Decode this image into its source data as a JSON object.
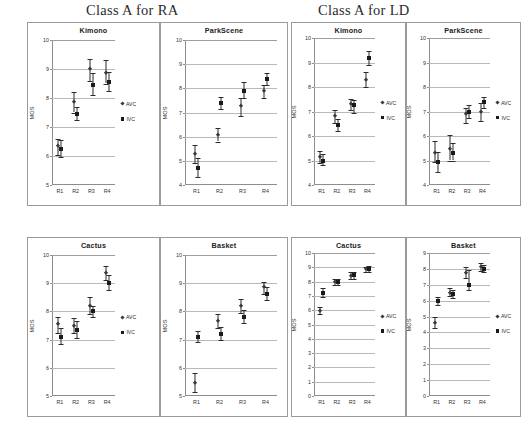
{
  "figure": {
    "groups": [
      {
        "id": "ra",
        "title": "Class A for RA"
      },
      {
        "id": "ld",
        "title": "Class A for LD"
      }
    ],
    "series_legend": [
      {
        "name": "AVC",
        "marker": "diamond-marker"
      },
      {
        "name": "IVC",
        "marker": "square-marker"
      }
    ],
    "axis": {
      "ylabel": "MOS",
      "xcategories": [
        "R1",
        "R2",
        "R3",
        "R4"
      ]
    }
  },
  "chart_data": [
    {
      "id": "ra-kimono",
      "type": "scatter",
      "group": "Class A for RA",
      "title": "Kimono",
      "xlabel": "",
      "ylabel": "MOS",
      "ylim": [
        5,
        10
      ],
      "yticks": [
        5,
        6,
        7,
        8,
        9,
        10
      ],
      "grid": true,
      "legend_position": "right",
      "categories": [
        "R1",
        "R2",
        "R3",
        "R4"
      ],
      "series": [
        {
          "name": "AVC",
          "marker": "diamond",
          "values": [
            6.35,
            7.85,
            9.0,
            8.85
          ],
          "err_low": [
            6.05,
            7.5,
            8.6,
            8.5
          ],
          "err_high": [
            6.6,
            8.2,
            9.35,
            9.3
          ]
        },
        {
          "name": "IVC",
          "marker": "square",
          "values": [
            6.25,
            7.45,
            8.45,
            8.55
          ],
          "err_low": [
            5.95,
            7.25,
            8.1,
            8.25
          ],
          "err_high": [
            6.55,
            7.7,
            8.85,
            8.9
          ]
        }
      ]
    },
    {
      "id": "ra-parkscene",
      "type": "scatter",
      "group": "Class A for RA",
      "title": "ParkScene",
      "xlabel": "",
      "ylabel": "MOS",
      "ylim": [
        4,
        10
      ],
      "yticks": [
        4,
        5,
        6,
        7,
        8,
        9,
        10
      ],
      "grid": true,
      "legend_position": "none",
      "categories": [
        "R1",
        "R2",
        "R3",
        "R4"
      ],
      "series": [
        {
          "name": "AVC",
          "marker": "diamond",
          "values": [
            5.3,
            6.05,
            7.25,
            7.9
          ],
          "err_low": [
            4.9,
            5.8,
            6.85,
            7.6
          ],
          "err_high": [
            5.65,
            6.35,
            7.6,
            8.15
          ]
        },
        {
          "name": "IVC",
          "marker": "square",
          "values": [
            4.7,
            7.4,
            7.9,
            8.4
          ],
          "err_low": [
            4.35,
            7.15,
            7.6,
            8.15
          ],
          "err_high": [
            5.1,
            7.65,
            8.25,
            8.65
          ]
        }
      ]
    },
    {
      "id": "ra-cactus",
      "type": "scatter",
      "group": "Class A for RA",
      "title": "Cactus",
      "xlabel": "",
      "ylabel": "MOS",
      "ylim": [
        5,
        10
      ],
      "yticks": [
        5,
        6,
        7,
        8,
        9,
        10
      ],
      "grid": true,
      "legend_position": "right",
      "categories": [
        "R1",
        "R2",
        "R3",
        "R4"
      ],
      "series": [
        {
          "name": "AVC",
          "marker": "diamond",
          "values": [
            7.55,
            7.5,
            8.2,
            9.35
          ],
          "err_low": [
            7.25,
            7.25,
            7.9,
            9.1
          ],
          "err_high": [
            7.8,
            7.75,
            8.5,
            9.6
          ]
        },
        {
          "name": "IVC",
          "marker": "square",
          "values": [
            7.1,
            7.35,
            8.0,
            9.0
          ],
          "err_low": [
            6.85,
            7.05,
            7.8,
            8.75
          ],
          "err_high": [
            7.4,
            7.65,
            8.2,
            9.3
          ]
        }
      ]
    },
    {
      "id": "ra-basket",
      "type": "scatter",
      "group": "Class A for RA",
      "title": "Basket",
      "xlabel": "",
      "ylabel": "MOS",
      "ylim": [
        5,
        10
      ],
      "yticks": [
        5,
        6,
        7,
        8,
        9,
        10
      ],
      "grid": true,
      "legend_position": "none",
      "categories": [
        "R1",
        "R2",
        "R3",
        "R4"
      ],
      "series": [
        {
          "name": "AVC",
          "marker": "diamond",
          "values": [
            5.45,
            7.65,
            8.2,
            8.85
          ],
          "err_low": [
            5.15,
            7.4,
            7.95,
            8.6
          ],
          "err_high": [
            5.8,
            7.9,
            8.45,
            9.05
          ]
        },
        {
          "name": "IVC",
          "marker": "square",
          "values": [
            7.1,
            7.2,
            7.8,
            8.6
          ],
          "err_low": [
            6.9,
            7.0,
            7.6,
            8.4
          ],
          "err_high": [
            7.3,
            7.45,
            8.05,
            8.85
          ]
        }
      ]
    },
    {
      "id": "ld-kimono",
      "type": "scatter",
      "group": "Class A for LD",
      "title": "Kimono",
      "xlabel": "",
      "ylabel": "MOS",
      "ylim": [
        4,
        10
      ],
      "yticks": [
        4,
        5,
        6,
        7,
        8,
        9,
        10
      ],
      "grid": true,
      "legend_position": "right",
      "categories": [
        "R1",
        "R2",
        "R3",
        "R4"
      ],
      "series": [
        {
          "name": "AVC",
          "marker": "diamond",
          "values": [
            5.15,
            6.8,
            7.3,
            8.3
          ],
          "err_low": [
            4.9,
            6.55,
            7.05,
            8.0
          ],
          "err_high": [
            5.4,
            7.05,
            7.5,
            8.6
          ]
        },
        {
          "name": "IVC",
          "marker": "square",
          "values": [
            5.0,
            6.45,
            7.25,
            9.2
          ],
          "err_low": [
            4.8,
            6.2,
            6.95,
            8.9
          ],
          "err_high": [
            5.25,
            6.7,
            7.45,
            9.45
          ]
        }
      ]
    },
    {
      "id": "ld-parkscene",
      "type": "scatter",
      "group": "Class A for LD",
      "title": "ParkScene",
      "xlabel": "",
      "ylabel": "MOS",
      "ylim": [
        4,
        10
      ],
      "yticks": [
        4,
        5,
        6,
        7,
        8,
        9,
        10
      ],
      "grid": true,
      "legend_position": "right",
      "categories": [
        "R1",
        "R2",
        "R3",
        "R4"
      ],
      "series": [
        {
          "name": "AVC",
          "marker": "diamond",
          "values": [
            5.3,
            5.45,
            6.9,
            7.0
          ],
          "err_low": [
            4.95,
            5.0,
            6.55,
            6.6
          ],
          "err_high": [
            5.8,
            6.05,
            7.15,
            7.35
          ]
        },
        {
          "name": "IVC",
          "marker": "square",
          "values": [
            4.95,
            5.3,
            7.0,
            7.4
          ],
          "err_low": [
            4.55,
            5.0,
            6.75,
            7.15
          ],
          "err_high": [
            5.35,
            5.7,
            7.25,
            7.6
          ]
        }
      ]
    },
    {
      "id": "ld-cactus",
      "type": "scatter",
      "group": "Class A for LD",
      "title": "Cactus",
      "xlabel": "",
      "ylabel": "MOS",
      "ylim": [
        0,
        10
      ],
      "yticks": [
        0,
        1,
        2,
        3,
        4,
        5,
        6,
        7,
        8,
        9,
        10
      ],
      "grid": true,
      "legend_position": "right",
      "categories": [
        "R1",
        "R2",
        "R3",
        "R4"
      ],
      "series": [
        {
          "name": "AVC",
          "marker": "diamond",
          "values": [
            5.95,
            7.95,
            8.4,
            8.85
          ],
          "err_low": [
            5.7,
            7.75,
            8.2,
            8.7
          ],
          "err_high": [
            6.2,
            8.15,
            8.65,
            9.05
          ]
        },
        {
          "name": "IVC",
          "marker": "square",
          "values": [
            7.2,
            7.95,
            8.45,
            8.9
          ],
          "err_low": [
            6.95,
            7.75,
            8.2,
            8.7
          ],
          "err_high": [
            7.55,
            8.15,
            8.7,
            9.1
          ]
        }
      ]
    },
    {
      "id": "ld-basket",
      "type": "scatter",
      "group": "Class A for LD",
      "title": "Basket",
      "xlabel": "",
      "ylabel": "MOS",
      "ylim": [
        0,
        9
      ],
      "yticks": [
        0,
        1,
        2,
        3,
        4,
        5,
        6,
        7,
        8,
        9
      ],
      "grid": true,
      "legend_position": "right",
      "categories": [
        "R1",
        "R2",
        "R3",
        "R4"
      ],
      "series": [
        {
          "name": "AVC",
          "marker": "diamond",
          "values": [
            4.6,
            6.5,
            7.75,
            8.1
          ],
          "err_low": [
            4.3,
            6.3,
            7.4,
            7.85
          ],
          "err_high": [
            4.95,
            6.8,
            8.15,
            8.4
          ]
        },
        {
          "name": "IVC",
          "marker": "square",
          "values": [
            5.95,
            6.4,
            7.0,
            8.0
          ],
          "err_low": [
            5.7,
            6.15,
            6.7,
            7.8
          ],
          "err_high": [
            6.2,
            6.7,
            7.9,
            8.25
          ]
        }
      ]
    }
  ]
}
